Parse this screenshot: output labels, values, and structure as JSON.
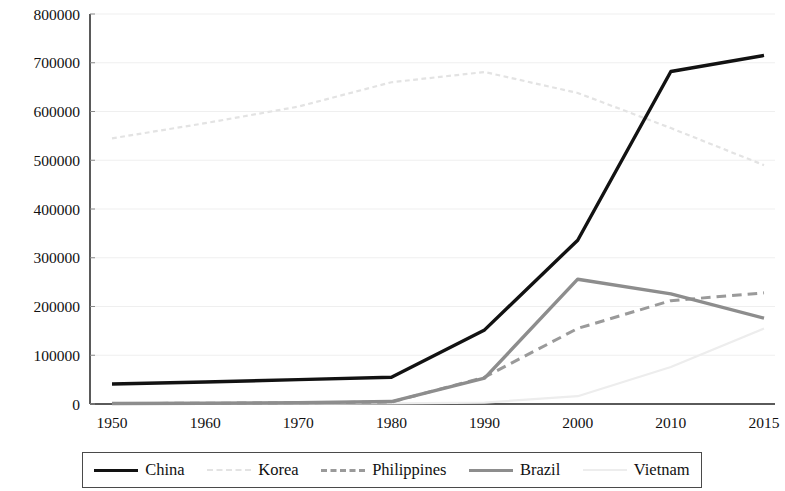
{
  "chart_data": {
    "type": "line",
    "title": "",
    "xlabel": "",
    "ylabel": "",
    "categories": [
      "1950",
      "1960",
      "1970",
      "1980",
      "1990",
      "2000",
      "2010",
      "2015"
    ],
    "x": [
      1950,
      1960,
      1970,
      1980,
      1990,
      2000,
      2010,
      2015
    ],
    "xlim": [
      1950,
      2015
    ],
    "ylim": [
      0,
      800000
    ],
    "ytick_labels": [
      "0",
      "100000",
      "200000",
      "300000",
      "400000",
      "500000",
      "600000",
      "700000",
      "800000"
    ],
    "yticks": [
      0,
      100000,
      200000,
      300000,
      400000,
      500000,
      600000,
      700000,
      800000
    ],
    "grid": "horizontal-faint",
    "legend_position": "bottom",
    "series": [
      {
        "name": "China",
        "color": "#121212",
        "style": "solid",
        "width": 3.4,
        "values": [
          41000,
          45000,
          50000,
          55000,
          152000,
          336000,
          682000,
          715000
        ]
      },
      {
        "name": "Korea",
        "color": "#e3e3e3",
        "style": "dotted",
        "width": 2.2,
        "values": [
          545000,
          576000,
          610000,
          660000,
          681000,
          638000,
          566000,
          490000
        ]
      },
      {
        "name": "Philippines",
        "color": "#9a9a9a",
        "style": "dashed",
        "width": 3.0,
        "values": [
          1000,
          1500,
          2500,
          4000,
          55000,
          155000,
          212000,
          228000
        ]
      },
      {
        "name": "Brazil",
        "color": "#8d8d8d",
        "style": "solid",
        "width": 3.4,
        "values": [
          1000,
          1500,
          2500,
          5000,
          53000,
          256000,
          226000,
          176000
        ]
      },
      {
        "name": "Vietnam",
        "color": "#ededed",
        "style": "solid",
        "width": 2.2,
        "values": [
          500,
          700,
          900,
          1200,
          3000,
          16000,
          76000,
          155000
        ]
      }
    ]
  },
  "legend": {
    "items": [
      {
        "label": "China"
      },
      {
        "label": "Korea"
      },
      {
        "label": "Philippines"
      },
      {
        "label": "Brazil"
      },
      {
        "label": "Vietnam"
      }
    ]
  }
}
